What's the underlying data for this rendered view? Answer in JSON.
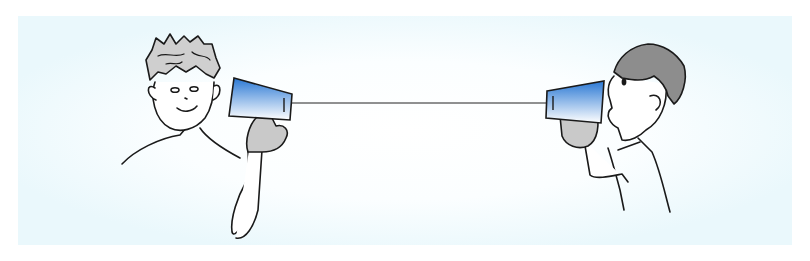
{
  "illustration": {
    "subject": "tin-can telephone",
    "figures": [
      {
        "role": "listener",
        "position": "left",
        "hair": "curly gray",
        "expression": "smiling",
        "holding": "cup at ear"
      },
      {
        "role": "speaker",
        "position": "right",
        "hair": "short dark gray",
        "expression": "talking",
        "holding": "cup at mouth"
      }
    ],
    "connector": "string"
  },
  "colors": {
    "background_panel": "#eefafd",
    "cup_top": "#2f7fd8",
    "cup_bottom": "#ffffff",
    "hair_left": "#cfcfcf",
    "hair_right": "#8d8d8d",
    "glove": "#c9c9c9",
    "line": "#1a1a1a"
  }
}
